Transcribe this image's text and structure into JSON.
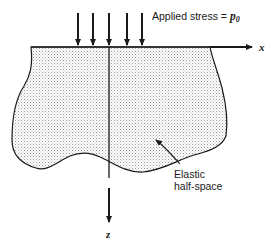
{
  "figure": {
    "applied_stress_label": "Applied stress = ",
    "applied_stress_symbol": "p",
    "applied_stress_subscript": "0",
    "x_axis_label": "x",
    "z_axis_label": "z",
    "body_label_line1": "Elastic",
    "body_label_line2": "half-space",
    "load_arrow_count": 5,
    "colors": {
      "ink": "#1a1a1a",
      "stipple": "#9a9a9a",
      "background": "#ffffff"
    }
  }
}
